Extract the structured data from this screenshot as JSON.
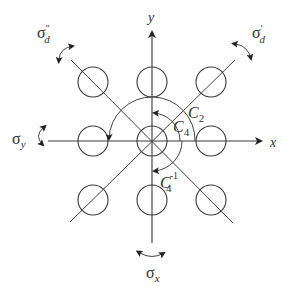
{
  "diagram": {
    "type": "symmetry-operations",
    "axes": {
      "x_label": "x",
      "y_label": "y"
    },
    "rotations": [
      {
        "id": "C2",
        "symbol": "C",
        "subscript": "2",
        "superscript": ""
      },
      {
        "id": "C4",
        "symbol": "C",
        "subscript": "4",
        "superscript": ""
      },
      {
        "id": "C4inv",
        "symbol": "C",
        "subscript": "4",
        "superscript": "-1"
      }
    ],
    "mirror_planes": [
      {
        "id": "sigma_x",
        "symbol": "σ",
        "subscript": "x",
        "prime": ""
      },
      {
        "id": "sigma_y",
        "symbol": "σ",
        "subscript": "y",
        "prime": ""
      },
      {
        "id": "sigma_d_prime",
        "symbol": "σ",
        "subscript": "d",
        "prime": "'"
      },
      {
        "id": "sigma_d_double_prime",
        "symbol": "σ",
        "subscript": "d",
        "prime": "''"
      }
    ],
    "atoms": {
      "count": 9,
      "arrangement": "3x3 grid centered on origin"
    }
  }
}
